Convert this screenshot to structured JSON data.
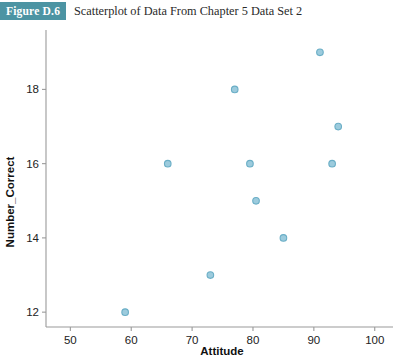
{
  "figure": {
    "badge": "Figure D.6",
    "title": "Scatterplot of Data From Chapter 5 Data Set 2",
    "badge_color": "#4c94a3",
    "title_color": "#2a2a2a"
  },
  "chart_data": {
    "type": "scatter",
    "title": "Scatterplot of Data From Chapter 5 Data Set 2",
    "xlabel": "Attitude",
    "ylabel": "Number_Correct",
    "xlim": [
      46,
      103
    ],
    "ylim": [
      11.6,
      19.6
    ],
    "xticks": [
      50,
      60,
      70,
      80,
      90,
      100
    ],
    "yticks": [
      12,
      14,
      16,
      18
    ],
    "grid": false,
    "legend": false,
    "marker_color": "#9ccbdd",
    "marker_edge_color": "#6aaec6",
    "points": [
      {
        "x": 59,
        "y": 12
      },
      {
        "x": 66,
        "y": 16
      },
      {
        "x": 73,
        "y": 13
      },
      {
        "x": 77,
        "y": 18
      },
      {
        "x": 79.5,
        "y": 16
      },
      {
        "x": 80.5,
        "y": 15
      },
      {
        "x": 85,
        "y": 14
      },
      {
        "x": 91,
        "y": 19
      },
      {
        "x": 93,
        "y": 16
      },
      {
        "x": 94,
        "y": 17
      }
    ]
  }
}
